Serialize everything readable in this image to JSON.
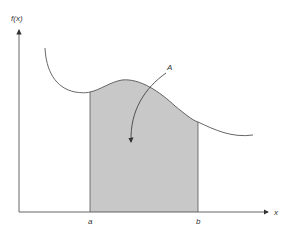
{
  "diagram": {
    "y_axis_label": "f(x)",
    "x_axis_label": "x",
    "lower_bound_label": "a",
    "upper_bound_label": "b",
    "area_label": "A",
    "colors": {
      "fill": "#c8c8c8",
      "stroke": "#555555",
      "text": "#333333"
    }
  }
}
